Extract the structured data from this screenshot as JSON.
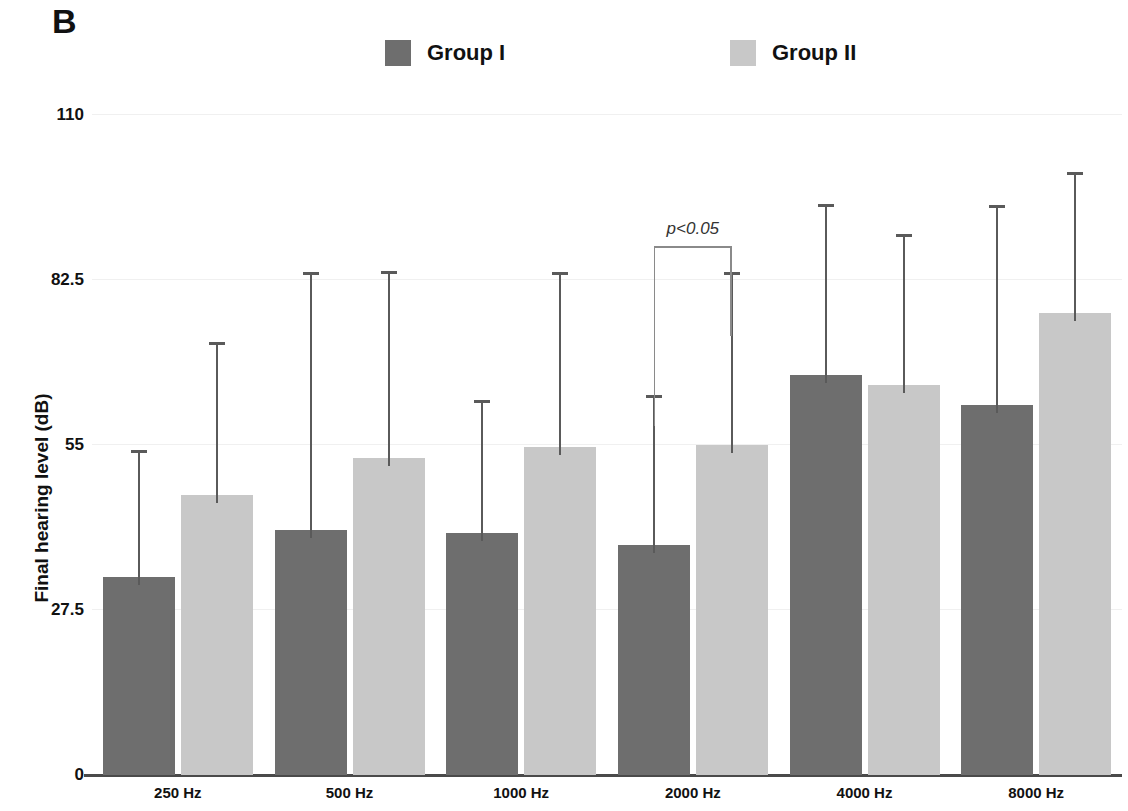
{
  "panel": {
    "letter": "B"
  },
  "legend": {
    "entries": [
      {
        "label": "Group I",
        "color": "#6e6e6e"
      },
      {
        "label": "Group II",
        "color": "#c8c8c8"
      }
    ]
  },
  "annotation": {
    "significance_text": "p<0.05",
    "applies_to_category": "2000 Hz"
  },
  "chart_data": {
    "type": "bar",
    "title": "",
    "xlabel": "",
    "ylabel": "Final hearing level (dB)",
    "categories": [
      "250 Hz",
      "500 Hz",
      "1000 Hz",
      "2000 Hz",
      "4000 Hz",
      "8000 Hz"
    ],
    "ylim": [
      0,
      110
    ],
    "yticks": [
      0,
      27.5,
      55,
      82.5,
      110
    ],
    "ytick_labels": [
      "0",
      "27.5",
      "55",
      "82.5",
      "110"
    ],
    "grid": true,
    "legend_position": "top",
    "error_bars": "upper-only",
    "series": [
      {
        "name": "Group I",
        "color": "#6e6e6e",
        "values": [
          33,
          40.8,
          40.3,
          38.3,
          66.7,
          61.7
        ],
        "error_upper": [
          53.7,
          83.3,
          62,
          62.8,
          94.7,
          94.5
        ]
      },
      {
        "name": "Group II",
        "color": "#c8c8c8",
        "values": [
          46.7,
          52.8,
          54.7,
          55,
          65,
          77
        ],
        "error_upper": [
          71.7,
          83.5,
          83.3,
          83.3,
          89.7,
          100
        ]
      }
    ],
    "annotations": [
      {
        "text": "p<0.05",
        "category": "2000 Hz",
        "type": "significance-bracket",
        "y": 88
      }
    ]
  }
}
